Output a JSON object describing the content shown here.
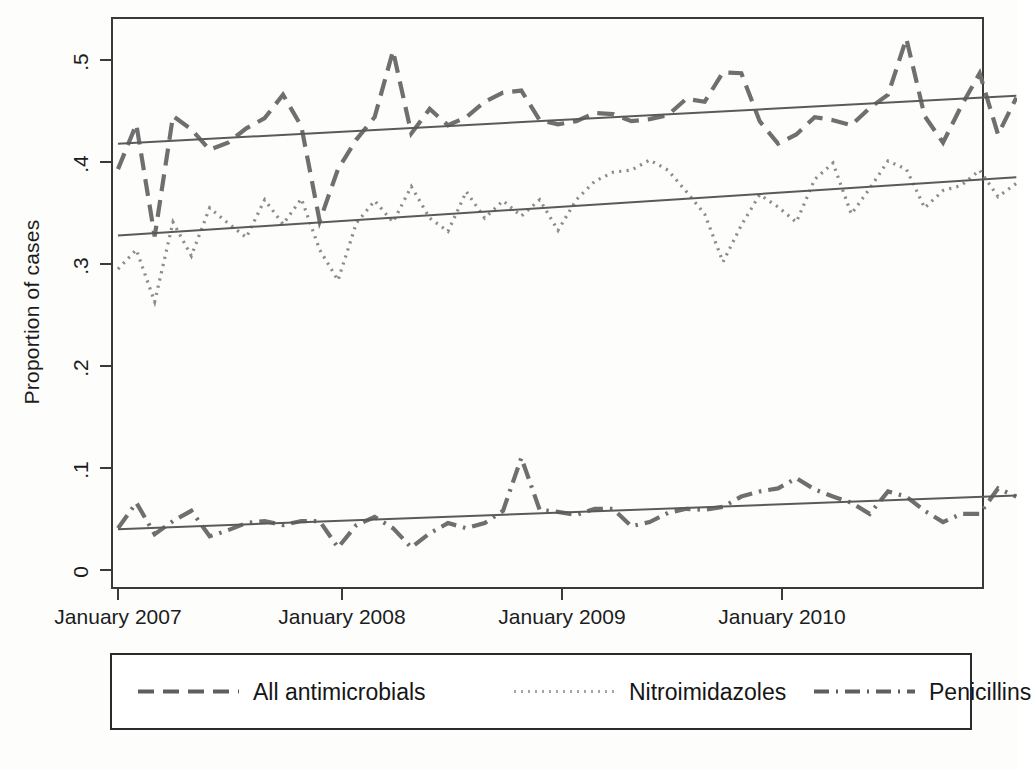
{
  "figure": {
    "title": "",
    "background_color": "#fdfdfc",
    "axis_color": "#3a3a3a",
    "series_color": "#6f6f6f",
    "trend_color": "#5a5a5a"
  },
  "axes": {
    "ylabel": "Proportion of cases",
    "yticks": [
      "0",
      ".1",
      ".2",
      ".3",
      ".4",
      ".5"
    ],
    "xticks": [
      "January 2007",
      "January 2008",
      "January 2009",
      "January 2010"
    ]
  },
  "legend": {
    "entries": [
      {
        "label": "All antimicrobials",
        "dash": "dashed",
        "key": "all_antimicrobials"
      },
      {
        "label": "Nitroimidazoles",
        "dash": "dotted",
        "key": "nitroimidazoles"
      },
      {
        "label": "Penicillins",
        "dash": "dash-dot",
        "key": "penicillins"
      }
    ]
  },
  "chart_data": {
    "type": "line",
    "title": "",
    "xlabel": "",
    "ylabel": "Proportion of cases",
    "ylim": [
      0,
      0.53
    ],
    "yticks": [
      0,
      0.1,
      0.2,
      0.3,
      0.4,
      0.5
    ],
    "ytick_labels": [
      "0",
      ".1",
      ".2",
      ".3",
      ".4",
      ".5"
    ],
    "xlim": [
      "2007-01",
      "2011-02"
    ],
    "xtick_labels": [
      "January 2007",
      "January 2008",
      "January 2009",
      "January 2010"
    ],
    "xtick_positions": [
      "2007-01",
      "2008-01",
      "2009-01",
      "2010-01"
    ],
    "grid": false,
    "legend_position": "below-axes",
    "x": [
      "2007-01",
      "2007-02",
      "2007-03",
      "2007-04",
      "2007-05",
      "2007-06",
      "2007-07",
      "2007-08",
      "2007-09",
      "2007-10",
      "2007-11",
      "2007-12",
      "2008-01",
      "2008-02",
      "2008-03",
      "2008-04",
      "2008-05",
      "2008-06",
      "2008-07",
      "2008-08",
      "2008-09",
      "2008-10",
      "2008-11",
      "2008-12",
      "2009-01",
      "2009-02",
      "2009-03",
      "2009-04",
      "2009-05",
      "2009-06",
      "2009-07",
      "2009-08",
      "2009-09",
      "2009-10",
      "2009-11",
      "2009-12",
      "2010-01",
      "2010-02",
      "2010-03",
      "2010-04",
      "2010-05",
      "2010-06",
      "2010-07",
      "2010-08",
      "2010-09",
      "2010-10",
      "2010-11",
      "2010-12",
      "2011-01",
      "2011-02"
    ],
    "series": [
      {
        "name": "All antimicrobials",
        "dash": "dashed",
        "color": "#6f6f6f",
        "values": [
          0.393,
          0.437,
          0.327,
          0.445,
          0.432,
          0.412,
          0.419,
          0.433,
          0.443,
          0.466,
          0.435,
          0.342,
          0.393,
          0.422,
          0.444,
          0.509,
          0.428,
          0.452,
          0.436,
          0.444,
          0.459,
          0.468,
          0.47,
          0.441,
          0.437,
          0.44,
          0.448,
          0.447,
          0.44,
          0.442,
          0.446,
          0.462,
          0.459,
          0.488,
          0.487,
          0.44,
          0.418,
          0.427,
          0.444,
          0.441,
          0.436,
          0.453,
          0.466,
          0.521,
          0.445,
          0.419,
          0.455,
          0.487,
          0.427,
          0.463
        ],
        "trend_start": 0.418,
        "trend_end": 0.465
      },
      {
        "name": "Nitroimidazoles",
        "dash": "dotted",
        "color": "#8c8c8c",
        "values": [
          0.295,
          0.314,
          0.263,
          0.341,
          0.308,
          0.355,
          0.34,
          0.326,
          0.363,
          0.339,
          0.364,
          0.314,
          0.284,
          0.34,
          0.362,
          0.341,
          0.376,
          0.345,
          0.332,
          0.371,
          0.345,
          0.362,
          0.347,
          0.363,
          0.333,
          0.363,
          0.381,
          0.39,
          0.392,
          0.402,
          0.392,
          0.371,
          0.349,
          0.302,
          0.338,
          0.368,
          0.356,
          0.341,
          0.383,
          0.399,
          0.349,
          0.374,
          0.401,
          0.393,
          0.355,
          0.372,
          0.377,
          0.392,
          0.366,
          0.379
        ],
        "trend_start": 0.328,
        "trend_end": 0.385
      },
      {
        "name": "Penicillins",
        "dash": "dash-dot",
        "color": "#6f6f6f",
        "values": [
          0.041,
          0.066,
          0.035,
          0.048,
          0.058,
          0.033,
          0.039,
          0.046,
          0.048,
          0.044,
          0.048,
          0.048,
          0.022,
          0.044,
          0.052,
          0.041,
          0.022,
          0.036,
          0.046,
          0.041,
          0.046,
          0.058,
          0.11,
          0.059,
          0.057,
          0.054,
          0.06,
          0.06,
          0.043,
          0.047,
          0.056,
          0.06,
          0.059,
          0.062,
          0.072,
          0.077,
          0.08,
          0.09,
          0.079,
          0.072,
          0.066,
          0.055,
          0.077,
          0.072,
          0.058,
          0.047,
          0.055,
          0.055,
          0.08,
          0.072
        ],
        "trend_start": 0.04,
        "trend_end": 0.073
      }
    ]
  }
}
